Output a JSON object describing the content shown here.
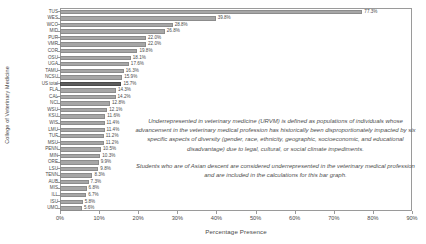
{
  "chart_data": {
    "type": "bar",
    "orientation": "horizontal",
    "title": "",
    "xlabel": "Percentage Presence",
    "ylabel": "College of Veterinary Medicine",
    "xlim": [
      0,
      90
    ],
    "grid": false,
    "legend": "none",
    "xticks": [
      "0%",
      "10%",
      "20%",
      "30%",
      "40%",
      "50%",
      "60%",
      "70%",
      "80%",
      "90%"
    ],
    "xtick_values": [
      0,
      10,
      20,
      30,
      40,
      50,
      60,
      70,
      80,
      90
    ],
    "highlight_category": "US total",
    "bar_color": "#a6a6a6",
    "highlight_color": "#5d5d5d",
    "categories": [
      "TUS",
      "WES",
      "WCO",
      "MID",
      "PUR",
      "VMR",
      "COR",
      "OSU",
      "UGA",
      "TAMU",
      "NCSU",
      "US total",
      "FLA",
      "CAL",
      "NCI",
      "WSU",
      "KSU",
      "WIS",
      "LMU",
      "TUF",
      "MSU",
      "PENN",
      "MIN",
      "ORE",
      "LSU",
      "TENN",
      "AUB",
      "MIS",
      "ILL",
      "ISU",
      "UMO"
    ],
    "values": [
      77.3,
      39.8,
      28.8,
      26.8,
      22.0,
      22.0,
      19.8,
      18.1,
      17.6,
      16.3,
      15.9,
      15.7,
      14.3,
      14.2,
      12.8,
      12.1,
      11.6,
      11.4,
      11.4,
      11.2,
      11.2,
      10.5,
      10.3,
      9.9,
      9.8,
      8.3,
      7.3,
      6.8,
      6.7,
      5.8,
      5.6
    ],
    "value_labels": [
      "77.3%",
      "39.8%",
      "28.8%",
      "26.8%",
      "22.0%",
      "22.0%",
      "19.8%",
      "18.1%",
      "17.6%",
      "16.3%",
      "15.9%",
      "15.7%",
      "14.3%",
      "14.2%",
      "12.8%",
      "12.1%",
      "11.6%",
      "11.4%",
      "11.4%",
      "11.2%",
      "11.2%",
      "10.5%",
      "10.3%",
      "9.9%",
      "9.8%",
      "8.3%",
      "7.3%",
      "6.8%",
      "6.7%",
      "5.8%",
      "5.6%"
    ],
    "annotations": [
      "Underrepresented in veterinary medicine (URVM) is defined as populations of individuals whose advancement in the veterinary medical profession has historically been disproportionately impacted by six specific aspects of diversity (gender, race, ethnicity, geographic, socioeconomic, and educational disadvantage) due to legal, cultural, or social climate impediments.",
      "Students who are of Asian descent are considered underrepresented in the veterinary medical profession and are included in the calculations for this bar graph."
    ]
  }
}
